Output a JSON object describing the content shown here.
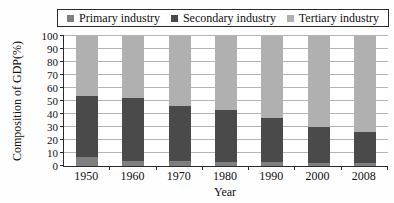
{
  "chart_data": {
    "type": "bar",
    "stacked": true,
    "title": "",
    "xlabel": "Year",
    "ylabel": "Composition of GDP(%)",
    "categories": [
      "1950",
      "1960",
      "1970",
      "1980",
      "1990",
      "2000",
      "2008"
    ],
    "series": [
      {
        "name": "Primary industry",
        "color": "#7f7f7f",
        "values": [
          7,
          4,
          4,
          3,
          3,
          2,
          2
        ]
      },
      {
        "name": "Secondary industry",
        "color": "#4a4a4a",
        "values": [
          47,
          48,
          42,
          40,
          34,
          28,
          24
        ]
      },
      {
        "name": "Tertiary industry",
        "color": "#b0b0b0",
        "values": [
          46,
          48,
          54,
          57,
          63,
          70,
          74
        ]
      }
    ],
    "ylim": [
      0,
      100
    ],
    "yticks": [
      0,
      10,
      20,
      30,
      40,
      50,
      60,
      70,
      80,
      90,
      100
    ],
    "grid": true,
    "legend_position": "top",
    "axis_color": "#2a2a2a",
    "gridline_color": "#b4b4b4"
  }
}
